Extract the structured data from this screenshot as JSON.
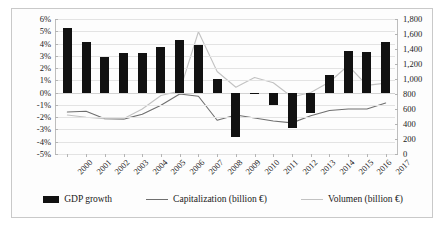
{
  "chart_data": {
    "type": "bar",
    "title": "",
    "xlabel": "",
    "ylabel": "",
    "grid": true,
    "legend_position": "bottom",
    "categories": [
      "2000",
      "2001",
      "2002",
      "2003",
      "2004",
      "2005",
      "2006",
      "2007",
      "2008",
      "2009",
      "2010",
      "2011",
      "2012",
      "2013",
      "2014",
      "2015",
      "2016",
      "2017"
    ],
    "axes": {
      "left": {
        "label": "",
        "ylim": [
          -5,
          6
        ],
        "tick_step": 1,
        "ticks": [
          "6%",
          "5%",
          "4%",
          "3%",
          "2%",
          "1%",
          "0%",
          "-1%",
          "-2%",
          "-3%",
          "-4%",
          "-5%"
        ],
        "tick_values": [
          6,
          5,
          4,
          3,
          2,
          1,
          0,
          -1,
          -2,
          -3,
          -4,
          -5
        ],
        "format": "percent"
      },
      "right": {
        "label": "",
        "ylim": [
          0,
          1800
        ],
        "tick_step": 200,
        "ticks": [
          "1,800",
          "1,600",
          "1,400",
          "1,200",
          "1,000",
          "800",
          "600",
          "400",
          "200",
          "0"
        ],
        "tick_values": [
          1800,
          1600,
          1400,
          1200,
          1000,
          800,
          600,
          400,
          200,
          0
        ],
        "format": "number"
      }
    },
    "series": [
      {
        "name": "GDP growth",
        "type": "bar",
        "axis": "left",
        "unit": "%",
        "color": "#111111",
        "values": [
          5.3,
          4.1,
          2.9,
          3.2,
          3.2,
          3.7,
          4.3,
          3.9,
          1.1,
          -3.6,
          0.0,
          -1.0,
          -2.9,
          -1.7,
          1.4,
          3.4,
          3.3,
          4.1
        ]
      },
      {
        "name": "Capitalization (billion €)",
        "type": "line",
        "axis": "right",
        "unit": "billion €",
        "color": "#6f6f6f",
        "values": [
          560,
          570,
          470,
          465,
          530,
          650,
          800,
          770,
          450,
          520,
          480,
          440,
          415,
          510,
          580,
          600,
          600,
          680
        ]
      },
      {
        "name": "Volumen (billion €)",
        "type": "line",
        "axis": "right",
        "unit": "billion €",
        "color": "#c2c2c2",
        "values": [
          520,
          490,
          470,
          470,
          600,
          780,
          840,
          1630,
          1100,
          890,
          1020,
          950,
          760,
          820,
          960,
          1180,
          915,
          945
        ]
      }
    ]
  },
  "legend": {
    "items": [
      {
        "label": "GDP growth",
        "marker": "bar-swatch",
        "color": "#111111"
      },
      {
        "label": "Capitalization (billion €)",
        "marker": "line-swatch",
        "color": "#6f6f6f"
      },
      {
        "label": "Volumen (billion €)",
        "marker": "line-swatch-light",
        "color": "#c2c2c2"
      }
    ]
  }
}
